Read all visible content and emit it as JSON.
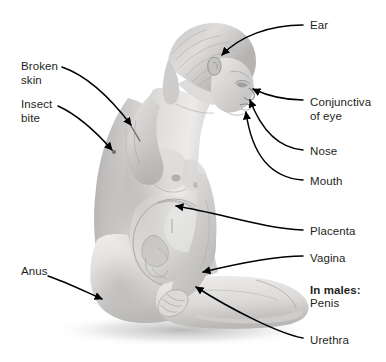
{
  "figure": {
    "background_color": "#ffffff",
    "line_color": "#000000",
    "text_color": "#231f20",
    "skin_light": "#e8e7e6",
    "skin_mid": "#c9c8c7",
    "skin_dark": "#a4a3a2",
    "shadow_color": "#bdbcbb"
  },
  "callouts": [
    {
      "id": "ear",
      "label": "Ear",
      "side": "right",
      "x": 310,
      "y": 19,
      "bold": false
    },
    {
      "id": "broken-skin",
      "label": "Broken\nskin",
      "side": "left",
      "x": 21,
      "y": 60,
      "bold": false
    },
    {
      "id": "conjunctiva-of-eye",
      "label": "Conjunctiva\nof eye",
      "side": "right",
      "x": 310,
      "y": 96,
      "bold": false
    },
    {
      "id": "insect-bite",
      "label": "Insect\nbite",
      "side": "left",
      "x": 21,
      "y": 98,
      "bold": false
    },
    {
      "id": "nose",
      "label": "Nose",
      "side": "right",
      "x": 310,
      "y": 145,
      "bold": false
    },
    {
      "id": "mouth",
      "label": "Mouth",
      "side": "right",
      "x": 310,
      "y": 175,
      "bold": false
    },
    {
      "id": "placenta",
      "label": "Placenta",
      "side": "right",
      "x": 310,
      "y": 225,
      "bold": false
    },
    {
      "id": "vagina",
      "label": "Vagina",
      "side": "right",
      "x": 310,
      "y": 252,
      "bold": false
    },
    {
      "id": "in-males-penis",
      "label": "In males:",
      "sub_label": "Penis",
      "side": "right",
      "x": 310,
      "y": 270,
      "bold": true
    },
    {
      "id": "anus",
      "label": "Anus",
      "side": "left",
      "x": 21,
      "y": 265,
      "bold": false
    },
    {
      "id": "urethra",
      "label": "Urethra",
      "side": "right",
      "x": 310,
      "y": 334,
      "bold": false
    }
  ]
}
